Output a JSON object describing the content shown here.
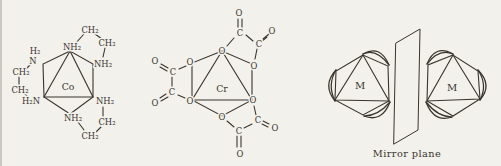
{
  "page": {
    "background_color": "#f3f1ec",
    "ink_color": "#39352c"
  },
  "cobalt_complex": {
    "metal": "Co",
    "labels": {
      "top_amine": "NH₂",
      "upper_left_h2": "H₂",
      "upper_left_n": "N",
      "upper_right_amine": "NH₂",
      "lower_left_amine": "H₂N",
      "lower_right_amine": "NH₂",
      "bottom_amine": "NH₂",
      "top_bridge_ch2_a": "CH₂",
      "top_bridge_ch2_b": "CH₂",
      "left_bridge_ch2_a": "CH₂",
      "left_bridge_ch2_b": "CH₂",
      "bottom_bridge_ch2_a": "CH₂",
      "bottom_bridge_ch2_b": "CH₂"
    }
  },
  "chromium_complex": {
    "metal": "Cr",
    "oxygen_label": "O",
    "carbon_label": "C"
  },
  "mirror_diagram": {
    "metal_label": "M",
    "caption": "Mirror plane"
  }
}
